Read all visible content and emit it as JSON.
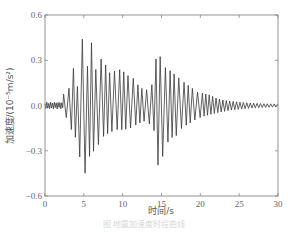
{
  "chart_data": {
    "type": "line",
    "title": "",
    "xlabel": "时间/s",
    "ylabel": "加速度/(10⁻⁵m/s²)",
    "xlim": [
      0,
      30
    ],
    "ylim": [
      -0.6,
      0.6
    ],
    "xticks": [
      0,
      5,
      10,
      15,
      20,
      25,
      30
    ],
    "yticks": [
      -0.6,
      -0.3,
      0.0,
      0.3,
      0.6
    ],
    "ytick_labels": [
      "−0.6",
      "−0.3",
      "0.0",
      "0.3",
      "0.6"
    ],
    "grid": false,
    "legend": null,
    "series": [
      {
        "name": "acceleration",
        "color": "#444444",
        "description": "seismic acceleration time history; quiet until ~2 s, main burst 3–8 s (max ≈0.54 at ~5.1 s, min ≈−0.48 at ~5.0 s), second burst 13–17 s (max ≈0.38 at ~14.5 s, min ≈−0.42 at ~14.6 s), decaying coda to ~30 s",
        "peaks": [
          {
            "t": 0.5,
            "a": 0.01
          },
          {
            "t": 1.5,
            "a": 0.015
          },
          {
            "t": 2.2,
            "a": 0.02
          },
          {
            "t": 2.6,
            "a": 0.13
          },
          {
            "t": 3.0,
            "a": 0.09
          },
          {
            "t": 3.6,
            "a": 0.26
          },
          {
            "t": 4.2,
            "a": 0.12
          },
          {
            "t": 5.0,
            "a": 0.54
          },
          {
            "t": 5.4,
            "a": 0.24
          },
          {
            "t": 6.0,
            "a": 0.42
          },
          {
            "t": 6.6,
            "a": 0.22
          },
          {
            "t": 7.2,
            "a": 0.31
          },
          {
            "t": 7.8,
            "a": 0.27
          },
          {
            "t": 8.4,
            "a": 0.21
          },
          {
            "t": 9.0,
            "a": 0.23
          },
          {
            "t": 9.8,
            "a": 0.24
          },
          {
            "t": 10.6,
            "a": 0.2
          },
          {
            "t": 11.4,
            "a": 0.18
          },
          {
            "t": 12.2,
            "a": 0.12
          },
          {
            "t": 13.0,
            "a": 0.1
          },
          {
            "t": 13.8,
            "a": 0.14
          },
          {
            "t": 14.5,
            "a": 0.38
          },
          {
            "t": 15.2,
            "a": 0.26
          },
          {
            "t": 15.9,
            "a": 0.24
          },
          {
            "t": 16.6,
            "a": 0.21
          },
          {
            "t": 17.3,
            "a": 0.18
          },
          {
            "t": 18.0,
            "a": 0.15
          },
          {
            "t": 18.8,
            "a": 0.12
          },
          {
            "t": 19.6,
            "a": 0.09
          },
          {
            "t": 20.4,
            "a": 0.08
          },
          {
            "t": 21.2,
            "a": 0.07
          },
          {
            "t": 22.0,
            "a": 0.05
          },
          {
            "t": 23.0,
            "a": 0.035
          },
          {
            "t": 24.5,
            "a": 0.025
          },
          {
            "t": 26.0,
            "a": 0.018
          },
          {
            "t": 28.0,
            "a": 0.012
          },
          {
            "t": 30.0,
            "a": 0.01
          }
        ],
        "troughs": [
          {
            "t": 2.8,
            "a": -0.08
          },
          {
            "t": 3.3,
            "a": -0.15
          },
          {
            "t": 4.0,
            "a": -0.22
          },
          {
            "t": 4.7,
            "a": -0.4
          },
          {
            "t": 5.0,
            "a": -0.48
          },
          {
            "t": 5.7,
            "a": -0.34
          },
          {
            "t": 6.3,
            "a": -0.3
          },
          {
            "t": 7.0,
            "a": -0.25
          },
          {
            "t": 7.6,
            "a": -0.2
          },
          {
            "t": 8.3,
            "a": -0.18
          },
          {
            "t": 9.2,
            "a": -0.16
          },
          {
            "t": 10.2,
            "a": -0.16
          },
          {
            "t": 11.0,
            "a": -0.15
          },
          {
            "t": 12.0,
            "a": -0.12
          },
          {
            "t": 13.0,
            "a": -0.1
          },
          {
            "t": 14.0,
            "a": -0.15
          },
          {
            "t": 14.6,
            "a": -0.42
          },
          {
            "t": 15.4,
            "a": -0.3
          },
          {
            "t": 16.0,
            "a": -0.22
          },
          {
            "t": 16.9,
            "a": -0.2
          },
          {
            "t": 17.6,
            "a": -0.15
          },
          {
            "t": 18.5,
            "a": -0.12
          },
          {
            "t": 19.5,
            "a": -0.09
          },
          {
            "t": 20.5,
            "a": -0.07
          }
        ]
      }
    ]
  },
  "caption": "图 地震加速度时程曲线"
}
